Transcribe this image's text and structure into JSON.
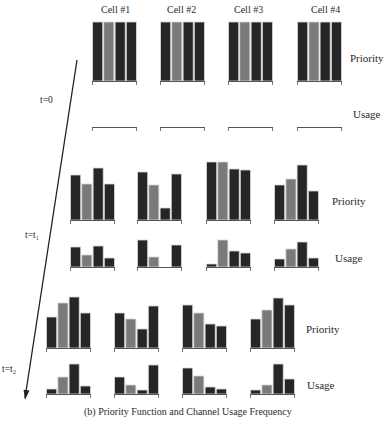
{
  "figure": {
    "caption": "(b) Priority Function and Channel Usage Frequency",
    "cells": [
      "Cell #1",
      "Cell #2",
      "Cell #3",
      "Cell #4"
    ],
    "row_labels": {
      "priority": "Priority",
      "usage": "Usage"
    },
    "colors": {
      "dark_bar": "#262626",
      "light_bar": "#7a7a7a",
      "bar_edge": "#d8d8d8",
      "axis": "#555555",
      "arrow": "#222222"
    },
    "time_steps": [
      {
        "label": "t=0",
        "label_pos": [
          34,
          101
        ],
        "cell_x": [
          92,
          160,
          228,
          297
        ],
        "cell_w": 45,
        "priority": {
          "baseline": 81,
          "tops": [
            [
              22,
              22,
              22,
              22
            ],
            [
              22,
              22,
              22,
              22
            ],
            [
              22,
              22,
              22,
              22
            ],
            [
              22,
              22,
              22,
              22
            ]
          ],
          "label_pos": [
            350,
            60
          ]
        },
        "usage": {
          "baseline": 127,
          "tops": [
            [
              127,
              127,
              127,
              127
            ],
            [
              127,
              127,
              127,
              127
            ],
            [
              127,
              127,
              127,
              127
            ],
            [
              127,
              127,
              127,
              127
            ]
          ],
          "label_pos": [
            353,
            115
          ]
        }
      },
      {
        "label": "t=t₁",
        "label_pos": [
          25,
          236
        ],
        "cell_x": [
          70,
          137,
          206,
          274
        ],
        "cell_w": 45,
        "priority": {
          "baseline": 220,
          "tops": [
            [
              175,
              184,
              168,
              184
            ],
            [
              172,
              185,
              208,
              174
            ],
            [
              162,
              162,
              169,
              170
            ],
            [
              185,
              179,
              165,
              191
            ]
          ],
          "label_pos": [
            332,
            203
          ]
        },
        "usage": {
          "baseline": 267,
          "tops": [
            [
              247,
              255,
              246,
              258
            ],
            [
              240,
              257,
              267,
              245
            ],
            [
              264,
              240,
              251,
              253
            ],
            [
              259,
              249,
              242,
              258
            ]
          ],
          "label_pos": [
            335,
            260
          ]
        }
      },
      {
        "label": "t=t₂",
        "label_pos": [
          3,
          370
        ],
        "cell_x": [
          46,
          114,
          182,
          250
        ],
        "cell_w": 45,
        "priority": {
          "baseline": 348,
          "tops": [
            [
              317,
              303,
              297,
              313
            ],
            [
              313,
              319,
              329,
              306
            ],
            [
              305,
              313,
              324,
              326
            ],
            [
              319,
              310,
              298,
              305
            ]
          ],
          "label_pos": [
            306,
            331
          ]
        },
        "usage": {
          "baseline": 394,
          "tops": [
            [
              389,
              377,
              364,
              386
            ],
            [
              377,
              385,
              390,
              365
            ],
            [
              368,
              376,
              387,
              389
            ],
            [
              390,
              385,
              364,
              379
            ]
          ],
          "label_pos": [
            307,
            387
          ]
        }
      }
    ],
    "light_bar_index": 1,
    "arrow": {
      "from": [
        77,
        60
      ],
      "to": [
        25,
        400
      ]
    }
  },
  "chart_data": {
    "type": "bar",
    "title": "(b) Priority Function and Channel Usage Frequency",
    "categories": [
      "Ch1",
      "Ch2",
      "Ch3",
      "Ch4"
    ],
    "panels": [
      {
        "time": "t=0",
        "metric": "Priority",
        "cells": {
          "Cell #1": [
            59,
            59,
            59,
            59
          ],
          "Cell #2": [
            59,
            59,
            59,
            59
          ],
          "Cell #3": [
            59,
            59,
            59,
            59
          ],
          "Cell #4": [
            59,
            59,
            59,
            59
          ]
        }
      },
      {
        "time": "t=0",
        "metric": "Usage",
        "cells": {
          "Cell #1": [
            0,
            0,
            0,
            0
          ],
          "Cell #2": [
            0,
            0,
            0,
            0
          ],
          "Cell #3": [
            0,
            0,
            0,
            0
          ],
          "Cell #4": [
            0,
            0,
            0,
            0
          ]
        }
      },
      {
        "time": "t=t1",
        "metric": "Priority",
        "cells": {
          "Cell #1": [
            45,
            36,
            52,
            36
          ],
          "Cell #2": [
            48,
            35,
            12,
            46
          ],
          "Cell #3": [
            58,
            58,
            51,
            50
          ],
          "Cell #4": [
            35,
            41,
            55,
            29
          ]
        }
      },
      {
        "time": "t=t1",
        "metric": "Usage",
        "cells": {
          "Cell #1": [
            20,
            12,
            21,
            9
          ],
          "Cell #2": [
            27,
            10,
            0,
            22
          ],
          "Cell #3": [
            3,
            27,
            16,
            14
          ],
          "Cell #4": [
            8,
            18,
            25,
            9
          ]
        }
      },
      {
        "time": "t=t2",
        "metric": "Priority",
        "cells": {
          "Cell #1": [
            31,
            45,
            51,
            35
          ],
          "Cell #2": [
            35,
            29,
            19,
            42
          ],
          "Cell #3": [
            43,
            35,
            24,
            22
          ],
          "Cell #4": [
            29,
            38,
            50,
            43
          ]
        }
      },
      {
        "time": "t=t2",
        "metric": "Usage",
        "cells": {
          "Cell #1": [
            5,
            17,
            30,
            8
          ],
          "Cell #2": [
            17,
            9,
            4,
            29
          ],
          "Cell #3": [
            26,
            18,
            7,
            5
          ],
          "Cell #4": [
            4,
            9,
            30,
            15
          ]
        }
      }
    ],
    "xlabel": "",
    "ylabel": "",
    "legend": "none",
    "grid": false
  }
}
